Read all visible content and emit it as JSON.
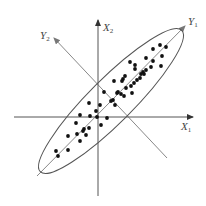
{
  "diagram": {
    "title": "",
    "labels": {
      "x1": {
        "main": "X",
        "sub": "1"
      },
      "x2": {
        "main": "X",
        "sub": "2"
      },
      "y1": {
        "main": "Y",
        "sub": "1"
      },
      "y2": {
        "main": "Y",
        "sub": "2"
      }
    },
    "colors": {
      "axis": "#555555",
      "rotated_axis": "#888888",
      "ellipse": "#555555",
      "point": "#111111"
    },
    "axes": {
      "x1": {
        "x1": 14,
        "y1": 117,
        "x2": 193,
        "y2": 117
      },
      "x2": {
        "x1": 98,
        "y1": 196,
        "x2": 98,
        "y2": 20
      },
      "y1": {
        "x1": 37,
        "y1": 176,
        "x2": 185,
        "y2": 26
      },
      "y2": {
        "x1": 167,
        "y1": 158,
        "x2": 54,
        "y2": 38
      }
    },
    "ellipse": {
      "cx": 111,
      "cy": 101,
      "rx": 100,
      "ry": 22,
      "rotate": -45
    },
    "points": [
      [
        166,
        47
      ],
      [
        160,
        45
      ],
      [
        153,
        49
      ],
      [
        162,
        56
      ],
      [
        146,
        58
      ],
      [
        153,
        61
      ],
      [
        161,
        66
      ],
      [
        130,
        62
      ],
      [
        135,
        65
      ],
      [
        135,
        69
      ],
      [
        151,
        67
      ],
      [
        146,
        70
      ],
      [
        143,
        72
      ],
      [
        141,
        74
      ],
      [
        144,
        74
      ],
      [
        140,
        78
      ],
      [
        125,
        76
      ],
      [
        123,
        79
      ],
      [
        122,
        81
      ],
      [
        137,
        80
      ],
      [
        134,
        83
      ],
      [
        131,
        86
      ],
      [
        126,
        88
      ],
      [
        132,
        93
      ],
      [
        114,
        81
      ],
      [
        118,
        92
      ],
      [
        121,
        94
      ],
      [
        124,
        96
      ],
      [
        117,
        93
      ],
      [
        113,
        100
      ],
      [
        104,
        92
      ],
      [
        115,
        105
      ],
      [
        111,
        101
      ],
      [
        89,
        103
      ],
      [
        100,
        105
      ],
      [
        96,
        111
      ],
      [
        90,
        116
      ],
      [
        80,
        115
      ],
      [
        97,
        117
      ],
      [
        107,
        118
      ],
      [
        101,
        125
      ],
      [
        89,
        128
      ],
      [
        84,
        129
      ],
      [
        76,
        123
      ],
      [
        83,
        131
      ],
      [
        77,
        134
      ],
      [
        68,
        136
      ],
      [
        86,
        135
      ],
      [
        80,
        141
      ],
      [
        56,
        151
      ],
      [
        58,
        156
      ],
      [
        68,
        150
      ]
    ]
  }
}
